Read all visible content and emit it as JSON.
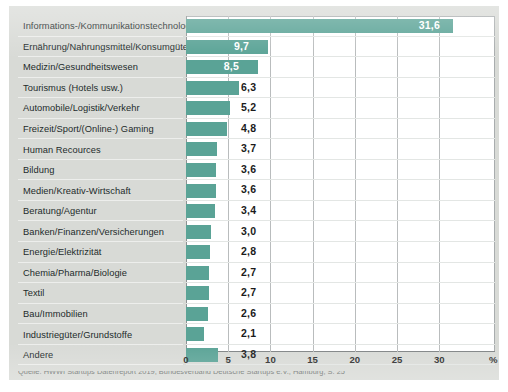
{
  "chart_data": {
    "type": "bar",
    "orientation": "horizontal",
    "title": "",
    "xlabel": "%",
    "ylabel": "",
    "xlim": [
      0,
      36.6
    ],
    "grid": true,
    "legend": null,
    "xticks": [
      "0",
      "5",
      "10",
      "15",
      "20",
      "25",
      "30"
    ],
    "xtick_values": [
      0,
      5,
      10,
      15,
      20,
      25,
      30
    ],
    "axis_unit_symbol": "%",
    "categories": [
      "Informations-/Kommunikationstechnologie",
      "Ernährung/Nahrungsmittel/Konsumgüter",
      "Medizin/Gesundheitswesen",
      "Tourismus (Hotels usw.)",
      "Automobile/Logistik/Verkehr",
      "Freizeit/Sport/(Online-) Gaming",
      "Human Recources",
      "Bildung",
      "Medien/Kreativ-Wirtschaft",
      "Beratung/Agentur",
      "Banken/Finanzen/Versicherungen",
      "Energie/Elektrizität",
      "Chemia/Pharma/Biologie",
      "Textil",
      "Bau/Immobilien",
      "Industriegüter/Grundstoffe",
      "Andere"
    ],
    "values": [
      31.6,
      9.7,
      8.5,
      6.3,
      5.2,
      4.8,
      3.7,
      3.6,
      3.6,
      3.4,
      3.0,
      2.8,
      2.7,
      2.7,
      2.6,
      2.1,
      3.8
    ],
    "value_labels": [
      "31,6",
      "9,7",
      "8,5",
      "6,3",
      "5,2",
      "4,8",
      "3,7",
      "3,6",
      "3,6",
      "3,4",
      "3,0",
      "2,8",
      "2,7",
      "2,7",
      "2,6",
      "2,1",
      "3,8"
    ],
    "label_inside": [
      true,
      true,
      true,
      false,
      false,
      false,
      false,
      false,
      false,
      false,
      false,
      false,
      false,
      false,
      false,
      false,
      false
    ],
    "colors": {
      "bar": "#5aa396",
      "plot_background": "#ffffff",
      "card_background": "#d8dad6",
      "gridline": "#b9bcbd",
      "label_inside": "#ffffff",
      "label_outside": "#1b1b1b",
      "text": "#1d2b2b"
    }
  },
  "caption": {
    "text": "Quelle: HWWI Startups Datenreport 2019, Bundesverband Deutsche Startups e.V., Hamburg, S. 25"
  }
}
